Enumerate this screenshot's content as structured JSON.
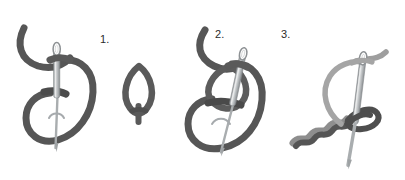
{
  "diagram": {
    "background_color": "#ffffff",
    "colors": {
      "thread_dark": "#5a5a5a",
      "thread_dark_shadow": "#494949",
      "thread_light": "#9a9a9a",
      "needle_body": "#b9bcbe",
      "needle_edge": "#8c9093",
      "needle_highlight": "#e3e5e6",
      "label_text": "#2b2b2b"
    },
    "steps": [
      {
        "number": "1.",
        "name": "step-1-loop-with-needle",
        "description": "Thread forms an S-shaped loop with needle passing through, needle point downward"
      },
      {
        "number": "2.",
        "name": "step-2-double-loop",
        "description": "Two overlapping loops with tilted needle passing through the upper loop"
      },
      {
        "number": "3.",
        "name": "step-3-finished-twisted-chain",
        "description": "Completed row of twisted chain stitches with needle drawing the working thread"
      }
    ],
    "middle_detail": {
      "name": "loop-detail",
      "description": "Small teardrop shaped thread loop with short tail"
    }
  }
}
